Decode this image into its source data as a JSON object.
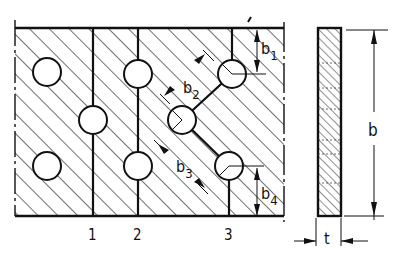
{
  "figure": {
    "type": "technical-drawing",
    "colors": {
      "ink": "#111111",
      "background": "#ffffff"
    }
  },
  "plate_view": {
    "section_lines": [
      {
        "id": "1",
        "label": "1"
      },
      {
        "id": "2",
        "label": "2"
      },
      {
        "id": "3",
        "label": "3"
      }
    ],
    "holes_count": 8,
    "dimensions": {
      "b1": {
        "base": "b",
        "sub": "1"
      },
      "b2": {
        "base": "b",
        "sub": "2"
      },
      "b3": {
        "base": "b",
        "sub": "3"
      },
      "b4": {
        "base": "b",
        "sub": "4"
      }
    }
  },
  "section_view": {
    "width_label": "b",
    "thickness_label": "t"
  }
}
